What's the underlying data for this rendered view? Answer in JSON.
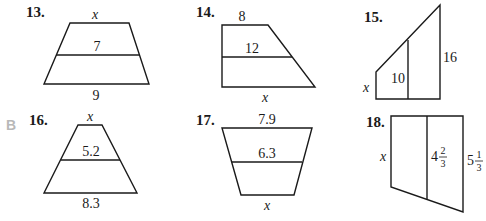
{
  "section_label": "B",
  "problems": [
    {
      "number": "13.",
      "shape": "trapezoid",
      "top": "x",
      "midsegment": "7",
      "bottom": "9"
    },
    {
      "number": "14.",
      "shape": "right-trapezoid",
      "top": "8",
      "midsegment": "12",
      "bottom": "x"
    },
    {
      "number": "15.",
      "shape": "right-trapezoid-vertical",
      "left": "x",
      "midsegment": "10",
      "right": "16"
    },
    {
      "number": "16.",
      "shape": "trapezoid",
      "top": "x",
      "midsegment": "5.2",
      "bottom": "8.3"
    },
    {
      "number": "17.",
      "shape": "trapezoid-inverted",
      "top": "7.9",
      "midsegment": "6.3",
      "bottom": "x"
    },
    {
      "number": "18.",
      "shape": "trapezoid-vertical",
      "left": "x",
      "midsegment": {
        "whole": "4",
        "num": "2",
        "den": "3"
      },
      "right": {
        "whole": "5",
        "num": "1",
        "den": "3"
      }
    }
  ],
  "colors": {
    "ink": "#1a1a1a",
    "section": "#b8b8b8"
  }
}
